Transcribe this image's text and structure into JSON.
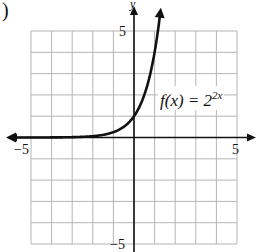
{
  "figure_label": ")",
  "chart_data": {
    "type": "line",
    "title": "",
    "function_label": {
      "prefix": "f(x) = 2",
      "exponent": "2x"
    },
    "xlabel": "",
    "ylabel": "y",
    "xlim": [
      -5,
      5
    ],
    "ylim": [
      -5,
      5
    ],
    "grid": true,
    "x_tick_labels": [
      {
        "value": -5,
        "label": "−5"
      },
      {
        "value": 5,
        "label": "5"
      }
    ],
    "y_tick_labels": [
      {
        "value": 5,
        "label": "5"
      },
      {
        "value": -5,
        "label": "−5"
      }
    ],
    "series": [
      {
        "name": "f(x) = 2^(2x)",
        "x": [
          -5.9,
          -5,
          -4,
          -3,
          -2,
          -1.5,
          -1,
          -0.5,
          0,
          0.5,
          1,
          1.25
        ],
        "y": [
          0.0,
          0.001,
          0.004,
          0.016,
          0.0625,
          0.125,
          0.25,
          0.5,
          1,
          2,
          4,
          5.66
        ]
      }
    ]
  },
  "colors": {
    "grid": "#b5b5b5",
    "axis": "#111111",
    "curve": "#111111"
  }
}
